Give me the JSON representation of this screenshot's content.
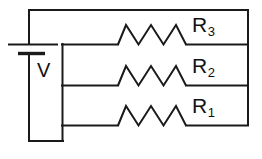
{
  "diagram": {
    "stroke_color": "#1a1a1a",
    "background_color": "#ffffff",
    "source_label": "V",
    "resistor_labels": [
      {
        "name": "R",
        "subscript": "3"
      },
      {
        "name": "R",
        "subscript": "2"
      },
      {
        "name": "R",
        "subscript": "1"
      }
    ]
  },
  "labels": {
    "voltage_source": "V",
    "resistor_3_name": "R",
    "resistor_3_sub": "3",
    "resistor_2_name": "R",
    "resistor_2_sub": "2",
    "resistor_1_name": "R",
    "resistor_1_sub": "1"
  }
}
